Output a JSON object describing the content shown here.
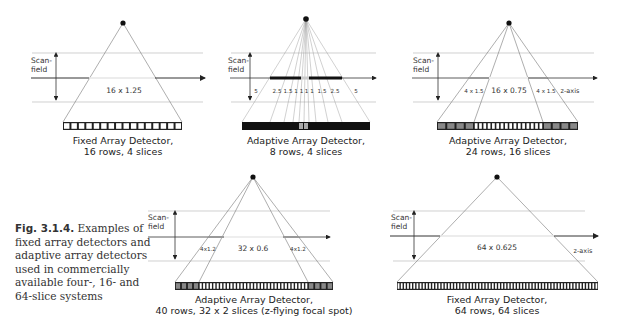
{
  "figure": {
    "label": "Fig. 3.1.4.",
    "caption": " Examples of fixed array detectors and adaptive array detectors used in commercially available four-, 16- and 64-slice systems"
  },
  "common": {
    "scanfield_line1": "Scan-",
    "scanfield_line2": "field",
    "z_axis_label": "z-axis"
  },
  "panels": [
    {
      "id": "fixed-16",
      "collimation": "16 x 1.25",
      "caption_line1": "Fixed Array Detector,",
      "caption_line2": "16 rows, 4 slices"
    },
    {
      "id": "adaptive-8",
      "widths": [
        "5",
        "2.5",
        "1.5",
        "1",
        "1",
        "1",
        "1",
        "1.5",
        "2.5",
        "5"
      ],
      "width_labels": "5   2.5 1.5 1 1 1 1.5 2.5   5",
      "caption_line1": "Adaptive Array Detector,",
      "caption_line2": "8 rows, 4 slices"
    },
    {
      "id": "adaptive-24",
      "outer_left": "4 x 1.5",
      "center": "16 x 0.75",
      "outer_right": "4 x 1.5",
      "caption_line1": "Adaptive Array Detector,",
      "caption_line2": "24 rows, 16 slices"
    },
    {
      "id": "adaptive-40",
      "outer_left": "4x1.2",
      "center": "32 x 0.6",
      "outer_right": "4x1.2",
      "caption_line1": "Adaptive Array Detector,",
      "caption_line2": "40 rows, 32 x 2 slices (z-flying focal spot)"
    },
    {
      "id": "fixed-64",
      "collimation": "64 x 0.625",
      "caption_line1": "Fixed Array Detector,",
      "caption_line2": "64 rows, 64 slices"
    }
  ],
  "colors": {
    "line": "#555555",
    "guide": "#bbbbbb",
    "cell_outer": "#888888",
    "cell_dark": "#222222",
    "highlight": "#999999"
  }
}
